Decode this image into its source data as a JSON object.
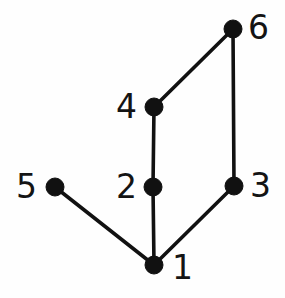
{
  "figure": {
    "width": 285,
    "height": 298,
    "background_color": "#fefefe",
    "ink_color": "#111111",
    "label_color": "#141414"
  },
  "chart_data": {
    "type": "diagram",
    "diagram_kind": "undirected-graph",
    "title": "",
    "xlabel": "",
    "ylabel": "",
    "grid": false,
    "legend": null,
    "axis_visible": false,
    "node_radius_px": 9,
    "edge_width_px": 3.6,
    "nodes": [
      {
        "id": "1",
        "label": "1",
        "x": 154,
        "y": 265,
        "label_x": 172,
        "label_y": 251,
        "label_side": "right",
        "degree": 3
      },
      {
        "id": "2",
        "label": "2",
        "x": 153,
        "y": 187,
        "label_x": 116,
        "label_y": 170,
        "label_side": "left",
        "degree": 2
      },
      {
        "id": "3",
        "label": "3",
        "x": 234,
        "y": 186,
        "label_x": 250,
        "label_y": 169,
        "label_side": "right",
        "degree": 2
      },
      {
        "id": "4",
        "label": "4",
        "x": 154,
        "y": 107,
        "label_x": 116,
        "label_y": 90,
        "label_side": "left",
        "degree": 2
      },
      {
        "id": "5",
        "label": "5",
        "x": 55,
        "y": 187,
        "label_x": 16,
        "label_y": 170,
        "label_side": "left",
        "degree": 1
      },
      {
        "id": "6",
        "label": "6",
        "x": 233,
        "y": 29,
        "label_x": 248,
        "label_y": 11,
        "label_side": "right",
        "degree": 2
      }
    ],
    "edges": [
      {
        "source": "1",
        "target": "2",
        "x1": 154,
        "y1": 265,
        "x2": 153,
        "y2": 187
      },
      {
        "source": "2",
        "target": "4",
        "x1": 153,
        "y1": 187,
        "x2": 154,
        "y2": 107
      },
      {
        "source": "4",
        "target": "6",
        "x1": 154,
        "y1": 107,
        "x2": 233,
        "y2": 29
      },
      {
        "source": "6",
        "target": "3",
        "x1": 233,
        "y1": 29,
        "x2": 234,
        "y2": 186
      },
      {
        "source": "3",
        "target": "1",
        "x1": 234,
        "y1": 186,
        "x2": 154,
        "y2": 265
      },
      {
        "source": "1",
        "target": "5",
        "x1": 154,
        "y1": 265,
        "x2": 55,
        "y2": 187
      }
    ],
    "node_count": 6,
    "edge_count": 6,
    "cycle": [
      "1",
      "2",
      "4",
      "6",
      "3",
      "1"
    ],
    "pendant_nodes": [
      "5"
    ]
  }
}
